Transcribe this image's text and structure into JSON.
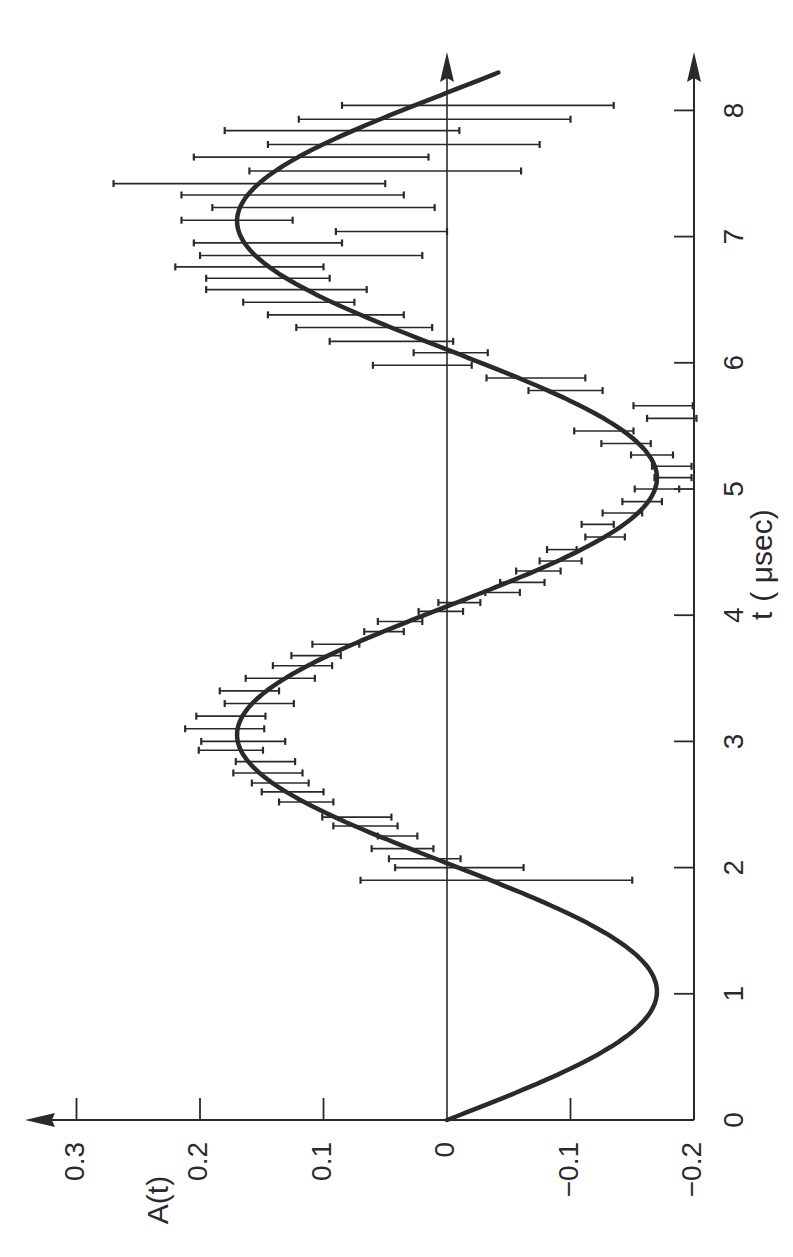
{
  "chart_data": {
    "type": "scatter",
    "orientation": "rotated 90 degrees counter-clockwise (t axis vertical pointing up, A(t) axis horizontal increasing to the left)",
    "title": "",
    "xlabel": "t (μsec)",
    "ylabel": "A(t)",
    "xlim": [
      0,
      8.3
    ],
    "ylim": [
      -0.2,
      0.3
    ],
    "x_ticks": [
      "0",
      "1",
      "2",
      "3",
      "4",
      "5",
      "6",
      "7",
      "8"
    ],
    "y_ticks": [
      "-0.2",
      "-0.1",
      "0",
      "0.1",
      "0.2",
      "0.3"
    ],
    "grid": false,
    "legend": null,
    "series": [
      {
        "name": "fit",
        "kind": "line",
        "function": "A(t) = -0.17 * sin(2*pi*t/4.07)",
        "amplitude": 0.17,
        "period_usec": 4.07,
        "t_range": [
          0,
          8.3
        ]
      },
      {
        "name": "data",
        "kind": "errorbar",
        "points": [
          {
            "t": 1.9,
            "A": -0.04,
            "err": 0.11
          },
          {
            "t": 2.0,
            "A": -0.01,
            "err": 0.052
          },
          {
            "t": 2.07,
            "A": 0.018,
            "err": 0.029
          },
          {
            "t": 2.15,
            "A": 0.036,
            "err": 0.025
          },
          {
            "t": 2.25,
            "A": 0.04,
            "err": 0.016
          },
          {
            "t": 2.33,
            "A": 0.066,
            "err": 0.026
          },
          {
            "t": 2.4,
            "A": 0.073,
            "err": 0.028
          },
          {
            "t": 2.52,
            "A": 0.114,
            "err": 0.022
          },
          {
            "t": 2.6,
            "A": 0.125,
            "err": 0.025
          },
          {
            "t": 2.67,
            "A": 0.135,
            "err": 0.023
          },
          {
            "t": 2.75,
            "A": 0.145,
            "err": 0.028
          },
          {
            "t": 2.84,
            "A": 0.147,
            "err": 0.024
          },
          {
            "t": 2.93,
            "A": 0.175,
            "err": 0.026
          },
          {
            "t": 3.0,
            "A": 0.165,
            "err": 0.034
          },
          {
            "t": 3.1,
            "A": 0.18,
            "err": 0.032
          },
          {
            "t": 3.2,
            "A": 0.175,
            "err": 0.028
          },
          {
            "t": 3.3,
            "A": 0.152,
            "err": 0.028
          },
          {
            "t": 3.4,
            "A": 0.16,
            "err": 0.024
          },
          {
            "t": 3.5,
            "A": 0.135,
            "err": 0.028
          },
          {
            "t": 3.6,
            "A": 0.117,
            "err": 0.024
          },
          {
            "t": 3.68,
            "A": 0.106,
            "err": 0.02
          },
          {
            "t": 3.77,
            "A": 0.09,
            "err": 0.019
          },
          {
            "t": 3.87,
            "A": 0.051,
            "err": 0.016
          },
          {
            "t": 3.95,
            "A": 0.038,
            "err": 0.018
          },
          {
            "t": 4.03,
            "A": 0.005,
            "err": 0.018
          },
          {
            "t": 4.1,
            "A": -0.01,
            "err": 0.017
          },
          {
            "t": 4.18,
            "A": -0.045,
            "err": 0.014
          },
          {
            "t": 4.26,
            "A": -0.061,
            "err": 0.018
          },
          {
            "t": 4.35,
            "A": -0.074,
            "err": 0.018
          },
          {
            "t": 4.43,
            "A": -0.092,
            "err": 0.017
          },
          {
            "t": 4.52,
            "A": -0.093,
            "err": 0.012
          },
          {
            "t": 4.62,
            "A": -0.128,
            "err": 0.016
          },
          {
            "t": 4.72,
            "A": -0.122,
            "err": 0.013
          },
          {
            "t": 4.81,
            "A": -0.142,
            "err": 0.016
          },
          {
            "t": 4.9,
            "A": -0.158,
            "err": 0.016
          },
          {
            "t": 5.0,
            "A": -0.17,
            "err": 0.018
          },
          {
            "t": 5.09,
            "A": -0.183,
            "err": 0.015
          },
          {
            "t": 5.18,
            "A": -0.182,
            "err": 0.016
          },
          {
            "t": 5.27,
            "A": -0.166,
            "err": 0.017
          },
          {
            "t": 5.36,
            "A": -0.145,
            "err": 0.02
          },
          {
            "t": 5.46,
            "A": -0.127,
            "err": 0.024
          },
          {
            "t": 5.56,
            "A": -0.182,
            "err": 0.02
          },
          {
            "t": 5.66,
            "A": -0.175,
            "err": 0.024
          },
          {
            "t": 5.78,
            "A": -0.096,
            "err": 0.03
          },
          {
            "t": 5.88,
            "A": -0.072,
            "err": 0.04
          },
          {
            "t": 5.98,
            "A": 0.02,
            "err": 0.04
          },
          {
            "t": 6.08,
            "A": -0.003,
            "err": 0.03
          },
          {
            "t": 6.17,
            "A": 0.045,
            "err": 0.05
          },
          {
            "t": 6.28,
            "A": 0.067,
            "err": 0.055
          },
          {
            "t": 6.38,
            "A": 0.09,
            "err": 0.055
          },
          {
            "t": 6.48,
            "A": 0.12,
            "err": 0.045
          },
          {
            "t": 6.58,
            "A": 0.13,
            "err": 0.065
          },
          {
            "t": 6.67,
            "A": 0.145,
            "err": 0.05
          },
          {
            "t": 6.76,
            "A": 0.16,
            "err": 0.06
          },
          {
            "t": 6.85,
            "A": 0.11,
            "err": 0.09
          },
          {
            "t": 6.95,
            "A": 0.145,
            "err": 0.06
          },
          {
            "t": 7.04,
            "A": 0.045,
            "err": 0.045
          },
          {
            "t": 7.13,
            "A": 0.17,
            "err": 0.045
          },
          {
            "t": 7.23,
            "A": 0.1,
            "err": 0.09
          },
          {
            "t": 7.33,
            "A": 0.125,
            "err": 0.09
          },
          {
            "t": 7.42,
            "A": 0.16,
            "err": 0.11
          },
          {
            "t": 7.52,
            "A": 0.05,
            "err": 0.11
          },
          {
            "t": 7.63,
            "A": 0.11,
            "err": 0.095
          },
          {
            "t": 7.73,
            "A": 0.035,
            "err": 0.11
          },
          {
            "t": 7.84,
            "A": 0.085,
            "err": 0.095
          },
          {
            "t": 7.93,
            "A": 0.01,
            "err": 0.11
          },
          {
            "t": 8.04,
            "A": -0.025,
            "err": 0.11
          }
        ]
      }
    ],
    "annotations": []
  },
  "axes": {
    "t_label": "t",
    "t_unit": "( μsec)",
    "a_label": "A(t)",
    "t_tick_labels": [
      "0",
      "1",
      "2",
      "3",
      "4",
      "5",
      "6",
      "7",
      "8"
    ],
    "a_tick_labels": [
      "0.3",
      "0.2",
      "0.1",
      "0",
      "-0.1",
      "-0.2"
    ]
  },
  "colors": {
    "ink": "#2a2a2a",
    "background": "#ffffff"
  }
}
